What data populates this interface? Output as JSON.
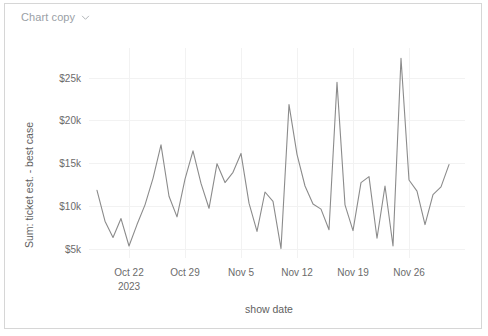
{
  "card": {
    "title": "Chart copy",
    "chevron_icon": "chevron-down-icon",
    "border_color": "#d6d6d6",
    "background_color": "#ffffff"
  },
  "chart_data": {
    "type": "line",
    "title": "Chart copy",
    "xlabel": "show date",
    "ylabel": "Sum: ticket est. - best case",
    "line_color": "#8b8b8b",
    "grid": true,
    "legend": "none",
    "ylim": [
      4000,
      28500
    ],
    "ytick_values": [
      5000,
      10000,
      15000,
      20000,
      25000
    ],
    "ytick_labels": [
      "$5k",
      "$10k",
      "$15k",
      "$20k",
      "$25k"
    ],
    "xtick_labels": [
      "Oct 22\n2023",
      "Oct 29",
      "Nov 5",
      "Nov 12",
      "Nov 19",
      "Nov 26"
    ],
    "xtick_primary": [
      "Oct 22",
      "Oct 29",
      "Nov 5",
      "Nov 12",
      "Nov 19",
      "Nov 26"
    ],
    "xtick_secondary": [
      "2023",
      "",
      "",
      "",
      "",
      ""
    ],
    "xlim": [
      "2023-10-17",
      "2023-12-03"
    ],
    "series": [
      {
        "name": "Sum: ticket est. - best case",
        "x": [
          "2023-10-18",
          "2023-10-19",
          "2023-10-20",
          "2023-10-21",
          "2023-10-22",
          "2023-10-23",
          "2023-10-24",
          "2023-10-25",
          "2023-10-26",
          "2023-10-27",
          "2023-10-28",
          "2023-10-29",
          "2023-10-30",
          "2023-10-31",
          "2023-11-01",
          "2023-11-02",
          "2023-11-03",
          "2023-11-04",
          "2023-11-05",
          "2023-11-06",
          "2023-11-07",
          "2023-11-08",
          "2023-11-09",
          "2023-11-10",
          "2023-11-11",
          "2023-11-12",
          "2023-11-13",
          "2023-11-14",
          "2023-11-15",
          "2023-11-16",
          "2023-11-17",
          "2023-11-18",
          "2023-11-19",
          "2023-11-20",
          "2023-11-21",
          "2023-11-22",
          "2023-11-23",
          "2023-11-24",
          "2023-11-25",
          "2023-11-26",
          "2023-11-27",
          "2023-11-28",
          "2023-11-29",
          "2023-11-30",
          "2023-12-01"
        ],
        "values": [
          11900,
          8300,
          6400,
          8600,
          5400,
          7900,
          10200,
          13300,
          17200,
          11200,
          8800,
          13200,
          16500,
          12700,
          9800,
          15000,
          12800,
          14000,
          16200,
          10400,
          7100,
          11700,
          10600,
          5100,
          21900,
          16100,
          12400,
          10300,
          9700,
          7300,
          24500,
          10200,
          7200,
          12800,
          13500,
          6300,
          12400,
          5400,
          27300,
          13100,
          11800,
          7900,
          11400,
          12300,
          14900
        ]
      }
    ]
  }
}
